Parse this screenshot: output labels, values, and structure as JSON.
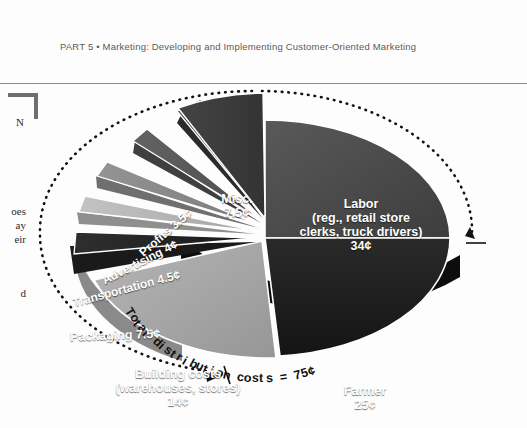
{
  "page": {
    "running_head": "PART 5  •  Marketing: Developing and Implementing Customer-Oriented Marketing",
    "margin_fragments": {
      "n": "N",
      "a": "oes",
      "b": "ay",
      "c": "eir",
      "d": "d"
    }
  },
  "figure": {
    "arc_caption": "Total distribution costs = 75¢"
  },
  "chart_data": {
    "type": "pie",
    "title": "Total distribution costs = 75¢",
    "unit": "¢",
    "total": 100,
    "legend_position": "on-slice",
    "categories": [
      "Labor (reg., retail store clerks, truck drivers)",
      "Farmer",
      "Building costs (warehouses, stores)",
      "Packaging",
      "Transportation",
      "Advertising",
      "Profits",
      "Misc."
    ],
    "values": [
      34,
      25,
      14,
      7.5,
      4.5,
      4,
      3.5,
      7.5
    ],
    "slices": [
      {
        "name": "Labor",
        "label": "Labor\n(reg., retail store\nclerks, truck drivers)\n34¢",
        "value": 34,
        "value_text": "34¢",
        "color": "#4a4a4a",
        "exploded": false
      },
      {
        "name": "Farmer",
        "label": "Farmer\n25¢",
        "value": 25,
        "value_text": "25¢",
        "color": "#1d1d1d",
        "exploded": false
      },
      {
        "name": "Building costs",
        "label": "Building costs\n(warehouses, stores)\n14¢",
        "value": 14,
        "value_text": "14¢",
        "color": "#a9a9a9",
        "exploded": false
      },
      {
        "name": "Packaging",
        "label": "Packaging 7.5¢",
        "value": 7.5,
        "value_text": "7.5¢",
        "color": "#262626",
        "exploded": true
      },
      {
        "name": "Transportation",
        "label": "Transportation 4.5¢",
        "value": 4.5,
        "value_text": "4.5¢",
        "color": "#b4b4b4",
        "exploded": true
      },
      {
        "name": "Advertising",
        "label": "Advertising 4¢",
        "value": 4,
        "value_text": "4¢",
        "color": "#8a8a8a",
        "exploded": true
      },
      {
        "name": "Profits",
        "label": "Profits 3.5¢",
        "value": 3.5,
        "value_text": "3.5¢",
        "color": "#595959",
        "exploded": true
      },
      {
        "name": "Misc.",
        "label": "Misc.\n7.5¢",
        "value": 7.5,
        "value_text": "7.5¢",
        "color": "#3d3d3d",
        "exploded": true
      }
    ]
  }
}
